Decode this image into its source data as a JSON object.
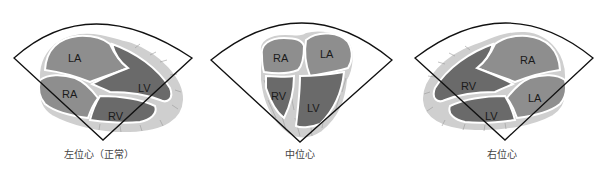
{
  "panels": [
    {
      "id": "levocardia",
      "caption": "左位心（正常）",
      "chambers": {
        "la": "LA",
        "ra": "RA",
        "lv": "LV",
        "rv": "RV"
      }
    },
    {
      "id": "mesocardia",
      "caption": "中位心",
      "chambers": {
        "la": "LA",
        "ra": "RA",
        "lv": "LV",
        "rv": "RV"
      }
    },
    {
      "id": "dextrocardia",
      "caption": "右位心",
      "chambers": {
        "la": "LA",
        "ra": "RA",
        "lv": "LV",
        "rv": "RV"
      }
    }
  ],
  "colors": {
    "atrium_fill": "#8e8e8e",
    "ventricle_fill": "#6a6a6a",
    "myocardium_fill": "#cfcfcf",
    "outline": "#ffffff",
    "sector_stroke": "#111111"
  }
}
